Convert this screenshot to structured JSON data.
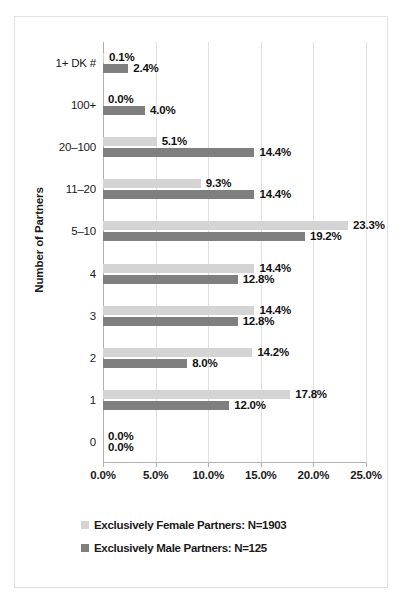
{
  "chart_data": {
    "type": "bar",
    "orientation": "horizontal",
    "title": "",
    "xlabel": "",
    "ylabel": "Number of Partners",
    "xlim": [
      0,
      25
    ],
    "xticks": [
      "0.0%",
      "5.0%",
      "10.0%",
      "15.0%",
      "20.0%",
      "25.0%"
    ],
    "xtick_values": [
      0,
      5,
      10,
      15,
      20,
      25
    ],
    "grid": true,
    "legend_position": "bottom",
    "categories": [
      "1+ DK #",
      "100+",
      "20–100",
      "11–20",
      "5–10",
      "4",
      "3",
      "2",
      "1",
      "0"
    ],
    "series": [
      {
        "name": "Exclusively Female Partners: N=1903",
        "color": "#d4d4d4",
        "values": [
          0.1,
          0.0,
          5.1,
          9.3,
          23.3,
          14.4,
          14.4,
          14.2,
          17.8,
          0.0
        ],
        "labels": [
          "0.1%",
          "0.0%",
          "5.1%",
          "9.3%",
          "23.3%",
          "14.4%",
          "14.4%",
          "14.2%",
          "17.8%",
          "0.0%"
        ]
      },
      {
        "name": "Exclusively Male Partners: N=125",
        "color": "#7f7f7f",
        "values": [
          2.4,
          4.0,
          14.4,
          14.4,
          19.2,
          12.8,
          12.8,
          8.0,
          12.0,
          0.0
        ],
        "labels": [
          "2.4%",
          "4.0%",
          "14.4%",
          "14.4%",
          "19.2%",
          "12.8%",
          "12.8%",
          "8.0%",
          "12.0%",
          "0.0%"
        ]
      }
    ]
  },
  "legend": {
    "items": [
      {
        "label": "Exclusively Female Partners: N=1903",
        "color": "#d4d4d4"
      },
      {
        "label": "Exclusively Male Partners: N=125",
        "color": "#7f7f7f"
      }
    ]
  },
  "axis": {
    "y_title": "Number of Partners"
  }
}
